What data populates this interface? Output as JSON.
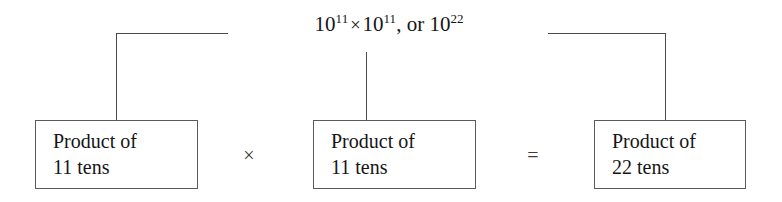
{
  "diagram": {
    "top_label": {
      "base1": "10",
      "exp1": "11",
      "times": "×",
      "base2": "10",
      "exp2": "11",
      "connector": ", or ",
      "base3": "10",
      "exp3": "22"
    },
    "boxes": [
      {
        "line1": "Product of",
        "line2": "11 tens"
      },
      {
        "line1": "Product of",
        "line2": "11 tens"
      },
      {
        "line1": "Product of",
        "line2": "22 tens"
      }
    ],
    "operators": {
      "multiply": "×",
      "equals": "="
    },
    "colors": {
      "line": "#4a4a4a",
      "box_border": "#5a5a5a",
      "text": "#151515",
      "background": "#ffffff"
    }
  }
}
